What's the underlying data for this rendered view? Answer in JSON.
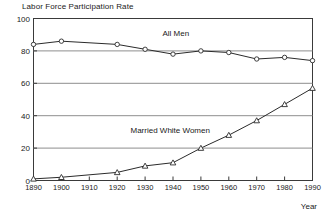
{
  "chart_data": {
    "type": "line",
    "title": "Labor Force Participation Rate",
    "xlabel": "Year",
    "ylabel": "",
    "x": [
      1890,
      1900,
      1910,
      1920,
      1930,
      1940,
      1950,
      1960,
      1970,
      1980,
      1990
    ],
    "xticklabels": [
      "1890",
      "1900",
      "1910",
      "1920",
      "1930",
      "1940",
      "1950",
      "1960",
      "1970",
      "1980",
      "1990"
    ],
    "yticklabels": [
      "0",
      "20",
      "40",
      "60",
      "80",
      "100"
    ],
    "yticks": [
      0,
      20,
      40,
      60,
      80,
      100
    ],
    "xlim": [
      1890,
      1990
    ],
    "ylim": [
      0,
      100
    ],
    "grid": "horizontal",
    "legend": "inline-annotations",
    "series": [
      {
        "name": "All Men",
        "marker": "circle",
        "color": "#2b2b2b",
        "annotation": "All Men",
        "x": [
          1890,
          1900,
          1920,
          1930,
          1940,
          1950,
          1960,
          1970,
          1980,
          1990
        ],
        "values": [
          84,
          86,
          84,
          81,
          78,
          80,
          79,
          75,
          76,
          74
        ]
      },
      {
        "name": "Married White Women",
        "marker": "triangle",
        "color": "#2b2b2b",
        "annotation": "Married White Women",
        "x": [
          1890,
          1900,
          1920,
          1930,
          1940,
          1950,
          1960,
          1970,
          1980,
          1990
        ],
        "values": [
          1,
          2,
          5,
          9,
          11,
          20,
          28,
          37,
          47,
          57
        ]
      }
    ],
    "annotations": [
      {
        "text": "All Men",
        "x": 1941,
        "y": 91
      },
      {
        "text": "Married White Women",
        "x": 1939,
        "y": 31
      }
    ]
  }
}
